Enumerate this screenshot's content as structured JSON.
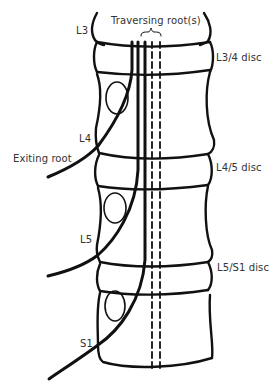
{
  "diagram": {
    "title_label": "Traversing root(s)",
    "vertebrae": [
      {
        "label": "L3"
      },
      {
        "label": "L4"
      },
      {
        "label": "L5"
      },
      {
        "label": "S1"
      }
    ],
    "discs": [
      {
        "label": "L3/4 disc"
      },
      {
        "label": "L4/5 disc"
      },
      {
        "label": "L5/S1 disc"
      }
    ],
    "exiting_root_label": "Exiting root",
    "colors": {
      "line": "#111111",
      "text": "#333333",
      "background": "#ffffff"
    }
  }
}
